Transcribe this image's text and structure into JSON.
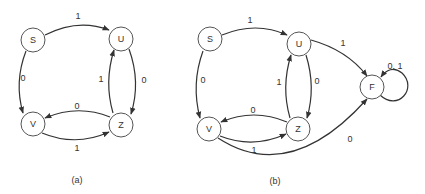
{
  "diagrams": [
    {
      "caption": "(a)",
      "nodes": {
        "S": {
          "label": "S"
        },
        "U": {
          "label": "U"
        },
        "V": {
          "label": "V"
        },
        "Z": {
          "label": "Z"
        }
      },
      "edges": [
        {
          "from": "S",
          "to": "U",
          "label": "1"
        },
        {
          "from": "S",
          "to": "V",
          "label": "0"
        },
        {
          "from": "U",
          "to": "Z",
          "label": "0"
        },
        {
          "from": "Z",
          "to": "U",
          "label": "1"
        },
        {
          "from": "Z",
          "to": "V",
          "label": "0"
        },
        {
          "from": "V",
          "to": "Z",
          "label": "1"
        }
      ]
    },
    {
      "caption": "(b)",
      "nodes": {
        "S": {
          "label": "S"
        },
        "U": {
          "label": "U"
        },
        "V": {
          "label": "V"
        },
        "Z": {
          "label": "Z"
        },
        "F": {
          "label": "F"
        }
      },
      "edges": [
        {
          "from": "S",
          "to": "U",
          "label": "1"
        },
        {
          "from": "S",
          "to": "V",
          "label": "0"
        },
        {
          "from": "U",
          "to": "Z",
          "label": "0"
        },
        {
          "from": "Z",
          "to": "U",
          "label": "1"
        },
        {
          "from": "Z",
          "to": "V",
          "label": "0"
        },
        {
          "from": "V",
          "to": "Z",
          "label": "1"
        },
        {
          "from": "U",
          "to": "F",
          "label": "1"
        },
        {
          "from": "V",
          "to": "F",
          "label": "0"
        },
        {
          "from": "F",
          "to": "F",
          "label": "0, 1"
        }
      ]
    }
  ]
}
